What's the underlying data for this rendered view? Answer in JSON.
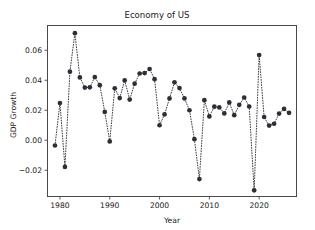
{
  "figure": {
    "background_color": "#ffffff",
    "axes_color": "#4a4a4a",
    "marker_color": "#2e2e38",
    "line_color": "#2b2b2b"
  },
  "chart_data": {
    "type": "line",
    "title": "Economy of US",
    "xlabel": "Year",
    "ylabel": "GDP Growth",
    "grid": false,
    "legend": false,
    "marker": "circle",
    "linestyle": "dotted",
    "xlim": [
      1977.5,
      1927.5
    ],
    "xlim_actual": [
      1977.5,
      2027.5
    ],
    "ylim": [
      -0.0375,
      0.0765
    ],
    "xticks": [
      1980,
      1990,
      2000,
      2010,
      2020
    ],
    "xticklabels": [
      "1980",
      "1990",
      "2000",
      "2010",
      "2020"
    ],
    "yticks": [
      -0.02,
      0.0,
      0.02,
      0.04,
      0.06
    ],
    "yticklabels": [
      "-0.02",
      "0.00",
      "0.02",
      "0.04",
      "0.06"
    ],
    "x": [
      1979,
      1980,
      1981,
      1982,
      1983,
      1984,
      1985,
      1986,
      1987,
      1988,
      1989,
      1990,
      1991,
      1992,
      1993,
      1994,
      1995,
      1996,
      1997,
      1998,
      1999,
      2000,
      2001,
      2002,
      2003,
      2004,
      2005,
      2006,
      2007,
      2008,
      2009,
      2010,
      2011,
      2012,
      2013,
      2014,
      2015,
      2016,
      2017,
      2018,
      2019,
      2020,
      2021,
      2022,
      2023,
      2024,
      2025,
      2026
    ],
    "y": [
      -0.0035,
      0.0248,
      -0.0178,
      0.0457,
      0.0714,
      0.0419,
      0.0351,
      0.0353,
      0.0421,
      0.0367,
      0.0189,
      -0.0008,
      0.0346,
      0.0281,
      0.0399,
      0.0271,
      0.0377,
      0.0445,
      0.0448,
      0.0475,
      0.0407,
      0.01,
      0.0172,
      0.0279,
      0.0386,
      0.0348,
      0.0279,
      0.02,
      0.0007,
      -0.0259,
      0.0267,
      0.0159,
      0.0224,
      0.0219,
      0.0179,
      0.0252,
      0.0167,
      0.0236,
      0.0285,
      0.0225,
      -0.0334,
      0.0568,
      0.0155,
      0.0098,
      0.011,
      0.0178,
      0.0209,
      0.0183
    ],
    "series_name": "GDP Growth",
    "point_count": 48,
    "min_value": -0.0334,
    "max_value": 0.0714
  }
}
